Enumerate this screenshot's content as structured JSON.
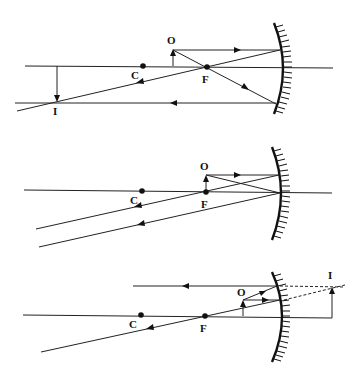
{
  "diagrams": [
    {
      "name": "object-beyond-focus",
      "labels": {
        "object": "O",
        "image": "I",
        "center": "C",
        "focus": "F"
      }
    },
    {
      "name": "object-at-focus",
      "labels": {
        "object": "O",
        "center": "C",
        "focus": "F"
      }
    },
    {
      "name": "object-within-focus",
      "labels": {
        "object": "O",
        "image": "I",
        "center": "C",
        "focus": "F"
      }
    }
  ]
}
